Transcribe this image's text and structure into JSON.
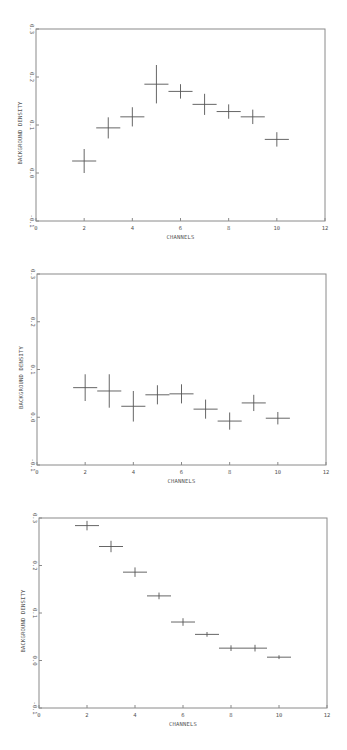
{
  "chart_data": [
    {
      "type": "scatter",
      "title": "",
      "xlabel": "CHANNELS",
      "ylabel": "BACKGROUND DENSITY",
      "xlim": [
        0,
        12
      ],
      "ylim": [
        -0.1,
        0.3
      ],
      "xticks": [
        "0",
        "2",
        "4",
        "6",
        "8",
        "10",
        "12"
      ],
      "yticks": [
        "-0.1",
        "0.0",
        "0.1",
        "0.2",
        "0.3"
      ],
      "grid": false,
      "legend": null,
      "error_bars": true,
      "x": [
        2,
        3,
        4,
        5,
        6,
        7,
        8,
        9,
        10
      ],
      "values": [
        0.025,
        0.094,
        0.117,
        0.185,
        0.17,
        0.143,
        0.128,
        0.117,
        0.07
      ],
      "x_err": 0.5,
      "y_err": [
        0.025,
        0.022,
        0.02,
        0.04,
        0.015,
        0.022,
        0.015,
        0.015,
        0.015
      ]
    },
    {
      "type": "scatter",
      "title": "",
      "xlabel": "CHANNELS",
      "ylabel": "BACKGROUND DENSITY",
      "xlim": [
        0,
        12
      ],
      "ylim": [
        -0.1,
        0.3
      ],
      "xticks": [
        "0",
        "2",
        "4",
        "6",
        "8",
        "10",
        "12"
      ],
      "yticks": [
        "-0.1",
        "0.0",
        "0.1",
        "0.2",
        "0.3"
      ],
      "grid": false,
      "legend": null,
      "error_bars": true,
      "x": [
        2,
        3,
        4,
        5,
        6,
        7,
        8,
        9,
        10
      ],
      "values": [
        0.062,
        0.055,
        0.023,
        0.047,
        0.049,
        0.017,
        -0.008,
        0.03,
        -0.002
      ],
      "x_err": 0.5,
      "y_err": [
        0.028,
        0.035,
        0.032,
        0.02,
        0.02,
        0.02,
        0.018,
        0.017,
        0.013
      ]
    },
    {
      "type": "scatter",
      "title": "",
      "xlabel": "CHANNELS",
      "ylabel": "BACKGROUND DENSITY",
      "xlim": [
        0,
        12
      ],
      "ylim": [
        -0.1,
        0.3
      ],
      "xticks": [
        "0",
        "2",
        "4",
        "6",
        "8",
        "10",
        "12"
      ],
      "yticks": [
        "-0.1",
        "0.0",
        "0.1",
        "0.2",
        "0.3"
      ],
      "grid": false,
      "legend": null,
      "error_bars": true,
      "x": [
        2,
        3,
        4,
        5,
        6,
        7,
        8,
        9,
        10
      ],
      "values": [
        0.284,
        0.24,
        0.186,
        0.136,
        0.081,
        0.055,
        0.026,
        0.026,
        0.007
      ],
      "x_err": 0.5,
      "y_err": [
        0.01,
        0.012,
        0.01,
        0.007,
        0.008,
        0.005,
        0.006,
        0.007,
        0.004
      ]
    }
  ],
  "layout": {
    "panels": [
      {
        "top": 0,
        "x0": 36,
        "x1": 325,
        "y_top": 29,
        "y_bot": 221
      },
      {
        "top": 0,
        "x0": 37,
        "x1": 326,
        "y_top": 274,
        "y_bot": 465
      },
      {
        "top": 0,
        "x0": 39,
        "x1": 327,
        "y_top": 518,
        "y_bot": 708
      }
    ]
  }
}
